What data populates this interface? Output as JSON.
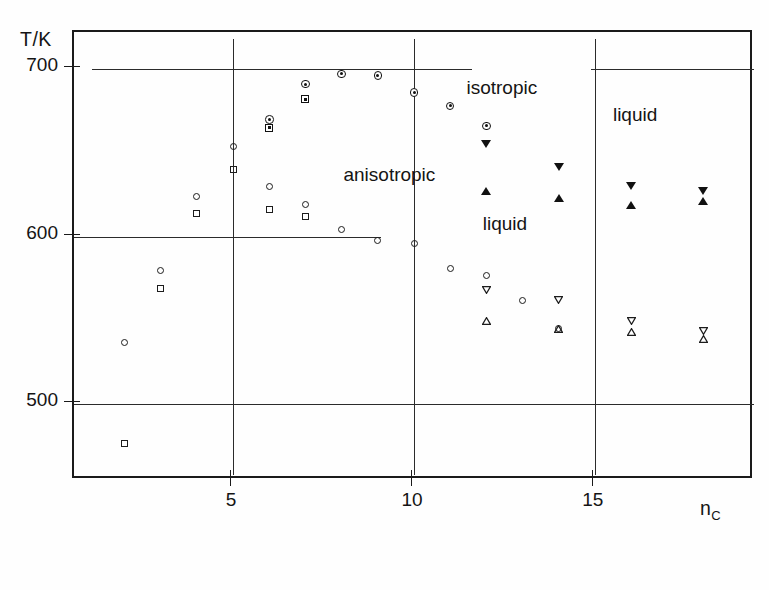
{
  "figure": {
    "ylabel": "T/K",
    "xlabel_base": "n",
    "xlabel_sub": "C",
    "caption": ""
  },
  "axes": {
    "y_ticks": [
      {
        "value": 700,
        "label": "700"
      },
      {
        "value": 600,
        "label": "600"
      },
      {
        "value": 500,
        "label": "500"
      }
    ],
    "x_ticks": [
      {
        "value": 5,
        "label": "5"
      },
      {
        "value": 10,
        "label": "10"
      },
      {
        "value": 15,
        "label": "15"
      }
    ]
  },
  "annotations": [
    {
      "text": "isotropic",
      "x": 11.45,
      "y": 688
    },
    {
      "text": "liquid",
      "x": 15.5,
      "y": 672
    },
    {
      "text": "anisotropic",
      "x": 8.05,
      "y": 636
    },
    {
      "text": "liquid",
      "x": 11.9,
      "y": 607
    }
  ],
  "chart_data": {
    "type": "scatter",
    "title": "",
    "xlabel": "n_C",
    "ylabel": "T/K",
    "xlim": [
      0.6,
      19.4
    ],
    "ylim": [
      455,
      722
    ],
    "grid": false,
    "legend": null,
    "reference_lines": {
      "horizontal": [
        {
          "y": 700,
          "x_from": 1.1,
          "x_to": 11.6
        },
        {
          "y": 700,
          "x_from": 14.9,
          "x_to": 19.4
        },
        {
          "y": 600,
          "x_from": 0.6,
          "x_to": 9.1
        },
        {
          "y": 500,
          "x_from": 0.6,
          "x_to": 19.4
        }
      ],
      "vertical": [
        {
          "x": 5,
          "y_from": 458,
          "y_to": 718
        },
        {
          "x": 10,
          "y_from": 458,
          "y_to": 718
        },
        {
          "x": 15,
          "y_from": 458,
          "y_to": 718
        }
      ]
    },
    "series": [
      {
        "name": "open-circle",
        "marker": "open-circle",
        "points": [
          [
            2,
            537
          ],
          [
            3,
            580
          ],
          [
            4,
            624
          ],
          [
            5,
            654
          ],
          [
            6,
            630
          ],
          [
            7,
            619
          ],
          [
            8,
            604
          ],
          [
            9,
            598
          ],
          [
            10,
            596
          ],
          [
            11,
            581
          ],
          [
            12,
            577
          ],
          [
            13,
            562
          ],
          [
            14,
            545
          ]
        ]
      },
      {
        "name": "open-square",
        "marker": "open-square",
        "points": [
          [
            2,
            477
          ],
          [
            3,
            569
          ],
          [
            4,
            614
          ],
          [
            5,
            640
          ],
          [
            6,
            616
          ],
          [
            7,
            612
          ]
        ]
      },
      {
        "name": "filled-circle",
        "marker": "filled-circle",
        "points": [
          [
            6,
            670
          ],
          [
            7,
            691
          ],
          [
            8,
            697
          ],
          [
            9,
            696
          ],
          [
            10,
            686
          ],
          [
            11,
            678
          ],
          [
            12,
            666
          ]
        ]
      },
      {
        "name": "filled-square",
        "marker": "filled-square",
        "points": [
          [
            6,
            665
          ],
          [
            7,
            682
          ]
        ]
      },
      {
        "name": "filled-down-triangle",
        "marker": "filled-down-triangle",
        "points": [
          [
            12,
            655
          ],
          [
            14,
            641
          ],
          [
            16,
            630
          ],
          [
            18,
            627
          ]
        ]
      },
      {
        "name": "filled-up-triangle",
        "marker": "filled-up-triangle",
        "points": [
          [
            12,
            627
          ],
          [
            14,
            623
          ],
          [
            16,
            619
          ],
          [
            18,
            621
          ]
        ]
      },
      {
        "name": "open-down-triangle",
        "marker": "open-down-triangle",
        "points": [
          [
            12,
            568
          ],
          [
            14,
            562
          ],
          [
            16,
            550
          ],
          [
            18,
            544
          ]
        ]
      },
      {
        "name": "open-up-triangle",
        "marker": "open-up-triangle",
        "points": [
          [
            12,
            550
          ],
          [
            14,
            545
          ],
          [
            16,
            543
          ],
          [
            18,
            539
          ]
        ]
      }
    ]
  }
}
